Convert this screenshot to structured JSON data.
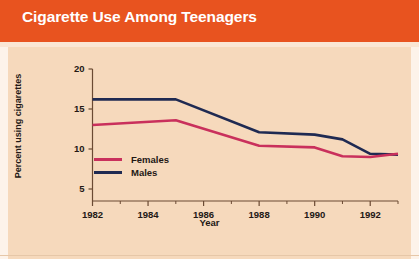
{
  "title": "Cigarette Use Among Teenagers",
  "colors": {
    "banner": "#e8531f",
    "background": "#f6d9bc",
    "title_text": "#ffffff",
    "axis": "#6b4a33",
    "text": "#231815",
    "females": "#c9305c",
    "males": "#1f2a52"
  },
  "legend": {
    "items": [
      {
        "label": "Females",
        "color": "#c9305c"
      },
      {
        "label": "Males",
        "color": "#1f2a52"
      }
    ]
  },
  "axes": {
    "y_title": "Percent using cigarettes",
    "x_title": "Year",
    "y_ticks": [
      "20",
      "15",
      "10",
      "5"
    ],
    "x_ticks": [
      "1982",
      "1984",
      "1986",
      "1988",
      "1990",
      "1992"
    ]
  },
  "chart_data": {
    "type": "line",
    "title": "Cigarette Use Among Teenagers",
    "xlabel": "Year",
    "ylabel": "Percent using cigarettes",
    "xlim": [
      1982,
      1993
    ],
    "ylim": [
      3.5,
      20
    ],
    "grid": false,
    "legend_position": "inside-left",
    "x_tick_labels": [
      "1982",
      "1984",
      "1986",
      "1988",
      "1990",
      "1992"
    ],
    "x_tick_values": [
      1982,
      1984,
      1986,
      1988,
      1990,
      1992
    ],
    "x_minor_ticks": [
      1983,
      1985,
      1987,
      1989,
      1991,
      1993
    ],
    "y_tick_labels": [
      "20",
      "15",
      "10",
      "5"
    ],
    "y_tick_values": [
      20,
      15,
      10,
      5
    ],
    "x": [
      1982,
      1985,
      1988,
      1990,
      1991,
      1992,
      1993
    ],
    "series": [
      {
        "name": "Males",
        "color": "#1f2a52",
        "values": [
          16.2,
          16.2,
          12.1,
          11.8,
          11.2,
          9.4,
          9.3
        ]
      },
      {
        "name": "Females",
        "color": "#c9305c",
        "values": [
          13.0,
          13.6,
          10.4,
          10.2,
          9.1,
          9.0,
          9.4
        ]
      }
    ]
  }
}
